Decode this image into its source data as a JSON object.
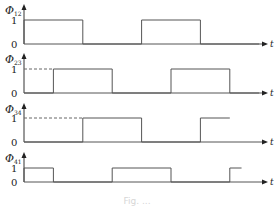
{
  "diagram": {
    "type": "timing-diagram",
    "time_axis_label": "t",
    "level_labels": {
      "high": "1",
      "low": "0"
    },
    "colors": {
      "line": "#555555",
      "text": "#222222",
      "dashed": "#666666"
    },
    "signals": [
      {
        "symbol": "Φ",
        "subscript": "12",
        "dashed_lead": false,
        "segments": [
          [
            0,
            1,
            1
          ],
          [
            1,
            2,
            0
          ],
          [
            2,
            3,
            1
          ],
          [
            3,
            4,
            0
          ]
        ]
      },
      {
        "symbol": "Φ",
        "subscript": "23",
        "dashed_lead": true,
        "segments": [
          [
            0,
            0.5,
            0
          ],
          [
            0.5,
            1.5,
            1
          ],
          [
            1.5,
            2.5,
            0
          ],
          [
            2.5,
            3.5,
            1
          ],
          [
            3.5,
            4,
            0
          ]
        ]
      },
      {
        "symbol": "Φ",
        "subscript": "34",
        "dashed_lead": true,
        "segments": [
          [
            0,
            1,
            0
          ],
          [
            1,
            2,
            1
          ],
          [
            2,
            3,
            0
          ],
          [
            3,
            3.5,
            1
          ]
        ]
      },
      {
        "symbol": "Φ",
        "subscript": "41",
        "dashed_lead": false,
        "segments": [
          [
            0,
            0.5,
            1
          ],
          [
            0.5,
            1.5,
            0
          ],
          [
            1.5,
            2.5,
            1
          ],
          [
            2.5,
            3.5,
            0
          ],
          [
            3.5,
            3.7,
            1
          ]
        ]
      }
    ]
  },
  "chart_data": {
    "type": "line",
    "title": "",
    "xlabel": "t",
    "ylabel": "",
    "ylim": [
      0,
      1
    ],
    "grid": false,
    "series": [
      {
        "name": "Φ12",
        "step_edges_in_half_periods": [
          0,
          1,
          2,
          3
        ],
        "values": [
          1,
          0,
          1,
          0
        ]
      },
      {
        "name": "Φ23",
        "step_edges_in_half_periods": [
          0,
          0.5,
          1.5,
          2.5,
          3.5
        ],
        "values": [
          0,
          1,
          0,
          1,
          0
        ]
      },
      {
        "name": "Φ34",
        "step_edges_in_half_periods": [
          0,
          1,
          2,
          3
        ],
        "values": [
          0,
          1,
          0,
          1
        ]
      },
      {
        "name": "Φ41",
        "step_edges_in_half_periods": [
          0,
          0.5,
          1.5,
          2.5,
          3.5
        ],
        "values": [
          1,
          0,
          1,
          0,
          1
        ]
      }
    ]
  },
  "caption": "Fig. ..."
}
